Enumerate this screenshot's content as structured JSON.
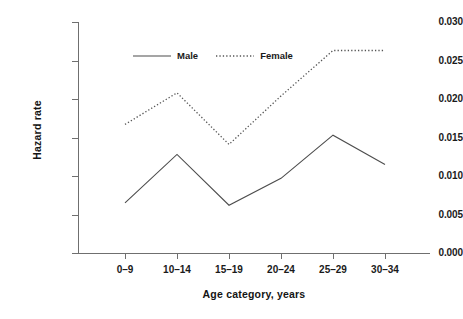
{
  "chart_data": {
    "type": "line",
    "title": "",
    "xlabel": "Age category, years",
    "ylabel": "Hazard rate",
    "categories": [
      "0–9",
      "10–14",
      "15–19",
      "20–24",
      "25–29",
      "30–34"
    ],
    "ylim": [
      0.0,
      0.03
    ],
    "yticks": [
      "0.000",
      "0.005",
      "0.010",
      "0.015",
      "0.020",
      "0.025",
      "0.030"
    ],
    "ytick_values": [
      0.0,
      0.005,
      0.01,
      0.015,
      0.02,
      0.025,
      0.03
    ],
    "grid": false,
    "legend_position": "upper-center-inside",
    "series": [
      {
        "name": "Male",
        "linestyle": "solid",
        "color": "#4d4d4d",
        "values": [
          0.0065,
          0.0128,
          0.0062,
          0.0097,
          0.0153,
          0.0115
        ]
      },
      {
        "name": "Female",
        "linestyle": "dotted",
        "color": "#555555",
        "values": [
          0.0167,
          0.0208,
          0.0141,
          0.0204,
          0.0263,
          0.0263
        ]
      }
    ]
  },
  "axis": {
    "y_title": "Hazard rate",
    "x_title": "Age category, years"
  },
  "legend": {
    "items": [
      {
        "label": "Male"
      },
      {
        "label": "Female"
      }
    ]
  },
  "colors": {
    "axis": "#6f6f6f",
    "male_line": "#4d4d4d",
    "female_line": "#555555",
    "text": "#1a1a1a",
    "background": "#ffffff"
  }
}
